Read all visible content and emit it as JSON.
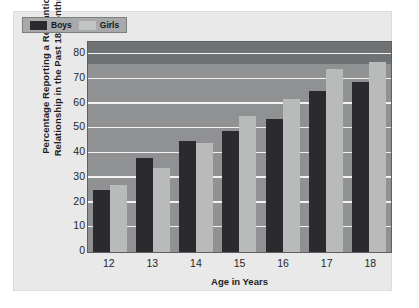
{
  "chart_data": {
    "type": "bar",
    "title": "",
    "xlabel": "Age in Years",
    "ylabel": "Percentage Reporting a Romantic Relationship in the Past 18 Months",
    "ylabel_lines": [
      "Percentage Reporting a Romantic",
      "Relationship in the Past 18 Months"
    ],
    "categories": [
      "12",
      "13",
      "14",
      "15",
      "16",
      "17",
      "18"
    ],
    "series": [
      {
        "name": "Boys",
        "color": "#2b2b2f",
        "values": [
          25,
          38,
          45,
          49,
          54,
          65,
          69
        ]
      },
      {
        "name": "Girls",
        "color": "#b9bbbb",
        "values": [
          27,
          34,
          44,
          55,
          62,
          74,
          77
        ]
      }
    ],
    "ylim": [
      0,
      85
    ],
    "yticks": [
      0,
      10,
      20,
      30,
      40,
      50,
      60,
      70,
      80
    ],
    "ytick_labels": [
      "0",
      "10",
      "20",
      "30",
      "40",
      "50",
      "60",
      "70",
      "80"
    ],
    "grid": true,
    "legend_position": "top-left",
    "plot_background": "#8f9193",
    "grid_color": "#f2f2f2",
    "figure_background": "#e9e9e9"
  }
}
